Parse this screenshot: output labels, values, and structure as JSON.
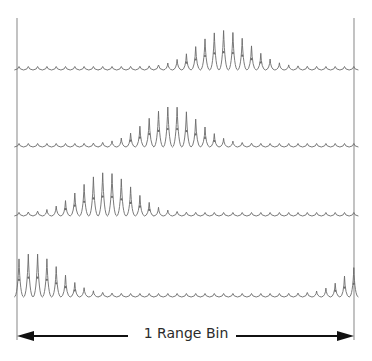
{
  "diagram": {
    "label": "1 Range Bin",
    "colors": {
      "trace": "#6b6b6b",
      "border": "#9a9a9a",
      "arrow": "#111111",
      "text": "#2b2b2b"
    },
    "bin": {
      "left_x": 17,
      "right_x": 354,
      "top_y": 18,
      "bottom_y": 340
    },
    "arrow": {
      "y": 336,
      "gap_left_x": 128,
      "gap_right_x": 226
    },
    "pulse": {
      "count": 37,
      "start_x": 19,
      "spacing": 9.3,
      "base_ripple": 3.5
    },
    "rows": [
      {
        "name": "row-1",
        "baseline_y": 70,
        "peak_center_x": 224,
        "peak_height": 36,
        "envelope_width": 26,
        "wrap": false
      },
      {
        "name": "row-2",
        "baseline_y": 147,
        "peak_center_x": 172,
        "peak_height": 37,
        "envelope_width": 26,
        "wrap": false
      },
      {
        "name": "row-3",
        "baseline_y": 216,
        "peak_center_x": 106,
        "peak_height": 40,
        "envelope_width": 26,
        "wrap": false
      },
      {
        "name": "row-4",
        "baseline_y": 297,
        "peak_center_x": 33,
        "peak_height": 40,
        "envelope_width": 26,
        "wrap": true
      }
    ]
  }
}
